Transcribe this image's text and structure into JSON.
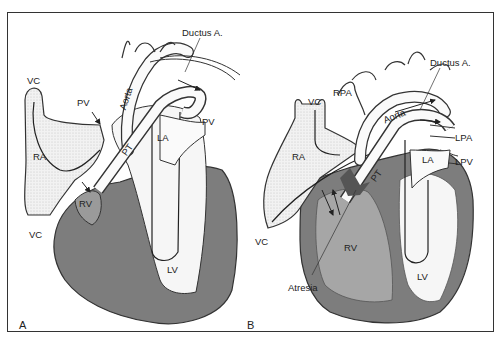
{
  "figure": {
    "type": "anatomical-diagram",
    "colors": {
      "frame": "#333333",
      "outline": "#222222",
      "myocardium_dark": "#7a7a7a",
      "rv_shade": "#9a9a9a",
      "chamber_light": "#f4f4f4",
      "vessel_fill": "#fafafa"
    }
  },
  "panels": [
    {
      "id": "A",
      "panel_label": "A",
      "labels": {
        "ductus": "Ductus A.",
        "vc_top": "VC",
        "pv_left": "PV",
        "aorta": "Aorta",
        "pv_right": "PV",
        "la": "LA",
        "pt": "PT",
        "ra": "RA",
        "rv": "RV",
        "vc_bottom": "VC",
        "lv": "LV"
      }
    },
    {
      "id": "B",
      "panel_label": "B",
      "labels": {
        "ductus": "Ductus A.",
        "vc_top": "VC",
        "rpa": "RPA",
        "aorta": "Aorta",
        "lpa": "LPA",
        "la": "LA",
        "lpv": "LPV",
        "pt": "PT",
        "ra": "RA",
        "vc_bottom": "VC",
        "rv": "RV",
        "lv": "LV",
        "atresia": "Atresia"
      }
    }
  ]
}
